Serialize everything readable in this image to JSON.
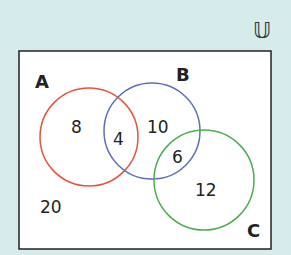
{
  "universe": {
    "symbol": "𝕌"
  },
  "sets": [
    {
      "name": "A",
      "color": "#e8543a"
    },
    {
      "name": "B",
      "color": "#5b6fbf"
    },
    {
      "name": "C",
      "color": "#4caf50"
    }
  ],
  "regions": {
    "a_only": "8",
    "a_and_b": "4",
    "b_only": "10",
    "b_and_c": "6",
    "c_only": "12",
    "outside": "20"
  },
  "colors": {
    "background": "#d6ecec",
    "box_fill": "#ffffff",
    "box_border": "#222222"
  }
}
